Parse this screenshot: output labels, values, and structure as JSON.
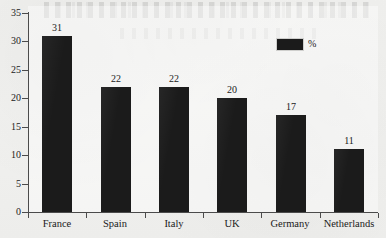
{
  "chart_data": {
    "type": "bar",
    "title": "",
    "subtitle": "",
    "xlabel": "",
    "ylabel": "",
    "categories": [
      "France",
      "Spain",
      "Italy",
      "UK",
      "Germany",
      "Netherlands"
    ],
    "values": [
      31,
      22,
      22,
      20,
      17,
      11
    ],
    "series": [
      {
        "name": "%",
        "values": [
          31,
          22,
          22,
          20,
          17,
          11
        ]
      }
    ],
    "data_labels": [
      "31",
      "22",
      "22",
      "20",
      "17",
      "11"
    ],
    "ylim": [
      0,
      35
    ],
    "ytick_labels": [
      "0",
      "5",
      "10",
      "15",
      "20",
      "25",
      "30",
      "35"
    ],
    "ytick_values": [
      0,
      5,
      10,
      15,
      20,
      25,
      30,
      35
    ],
    "grid": false,
    "legend": {
      "position": "top-right",
      "entries": [
        {
          "label": "%",
          "color": "#1b1b1b"
        }
      ]
    },
    "colors": {
      "bar": "#1b1b1b",
      "axis": "#4b4b4b",
      "text": "#1a1a1a",
      "plot_background": "#f1f1ef",
      "page_background": "#efefed"
    }
  }
}
